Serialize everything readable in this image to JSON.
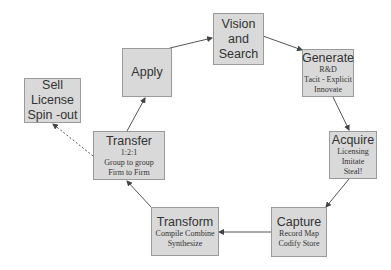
{
  "diagram": {
    "colors": {
      "box_fill": "#d9d9d9",
      "box_border": "#9a9a9a",
      "arrow": "#555555",
      "text": "#333333"
    },
    "nodes": {
      "vision": {
        "lines": [
          "Vision",
          "and",
          "Search"
        ]
      },
      "generate": {
        "title": "Generate",
        "details": [
          "R&D",
          "Tacit - Explicit",
          "Innovate"
        ]
      },
      "acquire": {
        "title": "Acquire",
        "details": [
          "Licensing",
          "Imitate",
          "Steal!"
        ]
      },
      "capture": {
        "title": "Capture",
        "details": [
          "Record Map",
          "Codify Store"
        ]
      },
      "transform": {
        "title": "Transform",
        "details": [
          "Compile Combine",
          "Synthesize"
        ]
      },
      "transfer": {
        "title": "Transfer",
        "details": [
          "1:2:1",
          "Group to group",
          "Firm to Firm"
        ]
      },
      "apply": {
        "lines": [
          "Apply"
        ]
      },
      "sell": {
        "lines": [
          "Sell",
          "License",
          "Spin -out"
        ]
      }
    },
    "edges": [
      {
        "from": "vision",
        "to": "generate",
        "style": "solid"
      },
      {
        "from": "generate",
        "to": "acquire",
        "style": "solid"
      },
      {
        "from": "acquire",
        "to": "capture",
        "style": "solid"
      },
      {
        "from": "capture",
        "to": "transform",
        "style": "solid"
      },
      {
        "from": "transform",
        "to": "transfer",
        "style": "solid"
      },
      {
        "from": "transfer",
        "to": "apply",
        "style": "solid"
      },
      {
        "from": "apply",
        "to": "vision",
        "style": "solid"
      },
      {
        "from": "transfer",
        "to": "sell",
        "style": "dashed"
      }
    ]
  }
}
